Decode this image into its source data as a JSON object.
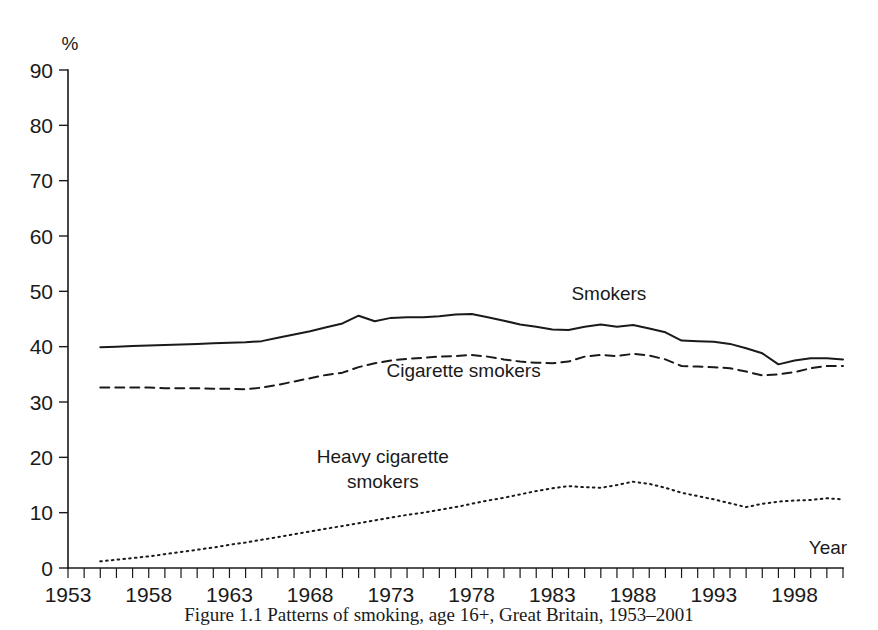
{
  "figure": {
    "caption": "Figure 1.1  Patterns of smoking, age 16+, Great Britain, 1953–2001",
    "background_color": "#ffffff",
    "ink_color": "#1a1a1a"
  },
  "chart_data": {
    "type": "line",
    "title": "",
    "subtitle": "",
    "xlabel": "Year",
    "ylabel": "%",
    "ylim": [
      0,
      90
    ],
    "xlim": [
      1953,
      2001
    ],
    "grid": false,
    "legend": "inline-annotations",
    "y_ticks": [
      0,
      10,
      20,
      30,
      40,
      50,
      60,
      70,
      80,
      90
    ],
    "x_ticks_labeled": [
      1953,
      1958,
      1963,
      1968,
      1973,
      1978,
      1983,
      1988,
      1993,
      1998
    ],
    "x_tick_interval_minor": 1,
    "x": [
      1955,
      1956,
      1957,
      1958,
      1959,
      1960,
      1961,
      1962,
      1963,
      1964,
      1965,
      1966,
      1967,
      1968,
      1969,
      1970,
      1971,
      1972,
      1973,
      1974,
      1975,
      1976,
      1977,
      1978,
      1979,
      1980,
      1981,
      1982,
      1983,
      1984,
      1985,
      1986,
      1987,
      1988,
      1989,
      1990,
      1991,
      1992,
      1993,
      1994,
      1995,
      1996,
      1997,
      1998,
      1999,
      2000,
      2001
    ],
    "series": [
      {
        "name": "Smokers",
        "style": "solid",
        "label_x": 1986.5,
        "label_y": 48.5,
        "values": [
          39.9,
          40.0,
          40.1,
          40.2,
          40.3,
          40.4,
          40.5,
          40.6,
          40.7,
          40.8,
          41.0,
          41.6,
          42.2,
          42.8,
          43.5,
          44.2,
          45.6,
          44.6,
          45.2,
          45.3,
          45.3,
          45.5,
          45.8,
          45.9,
          45.3,
          44.7,
          44.0,
          43.6,
          43.1,
          43.0,
          43.6,
          44.0,
          43.6,
          43.9,
          43.3,
          42.6,
          41.1,
          41.0,
          40.9,
          40.5,
          39.7,
          38.8,
          36.8,
          37.5,
          37.9,
          37.9,
          37.7
        ]
      },
      {
        "name": "Cigarette smokers",
        "style": "dashed",
        "label_x": 1977.5,
        "label_y": 34.5,
        "values": [
          32.6,
          32.6,
          32.6,
          32.6,
          32.5,
          32.5,
          32.5,
          32.4,
          32.4,
          32.3,
          32.6,
          33.1,
          33.7,
          34.3,
          34.9,
          35.3,
          36.3,
          37.0,
          37.5,
          37.8,
          38.0,
          38.2,
          38.3,
          38.5,
          38.2,
          37.7,
          37.3,
          37.1,
          37.0,
          37.3,
          38.2,
          38.5,
          38.3,
          38.7,
          38.4,
          37.7,
          36.5,
          36.4,
          36.3,
          36.1,
          35.5,
          34.8,
          35.0,
          35.4,
          36.1,
          36.5,
          36.5
        ]
      },
      {
        "name": "Heavy cigarette smokers",
        "style": "dotted",
        "label_x": 1972.5,
        "label_y": 19.0,
        "label_lines": [
          "Heavy cigarette",
          "smokers"
        ],
        "values": [
          1.2,
          1.5,
          1.8,
          2.1,
          2.5,
          2.9,
          3.3,
          3.7,
          4.2,
          4.6,
          5.1,
          5.6,
          6.1,
          6.6,
          7.1,
          7.6,
          8.1,
          8.6,
          9.1,
          9.6,
          10.0,
          10.5,
          11.0,
          11.6,
          12.2,
          12.7,
          13.3,
          13.9,
          14.4,
          14.8,
          14.6,
          14.5,
          15.0,
          15.6,
          15.2,
          14.5,
          13.6,
          13.0,
          12.4,
          11.7,
          11.0,
          11.6,
          12.0,
          12.2,
          12.3,
          12.6,
          12.4
        ]
      }
    ]
  }
}
